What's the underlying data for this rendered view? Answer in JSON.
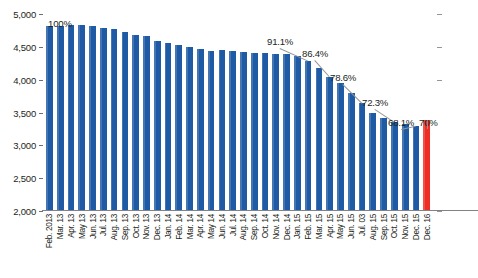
{
  "chart_data": {
    "type": "bar",
    "title": "",
    "subtitle": "",
    "xlabel": "",
    "ylabel": "",
    "ylim": [
      2000,
      5000
    ],
    "yticks": [
      "2,000",
      "2,500",
      "3,000",
      "3,500",
      "4,000",
      "4,500",
      "5,000"
    ],
    "ytick_values": [
      2000,
      2500,
      3000,
      3500,
      4000,
      4500,
      5000
    ],
    "grid": false,
    "legend": "none",
    "categories": [
      "Feb. 2013",
      "Mar. 13",
      "Apr. 13",
      "May 13",
      "Jun. 13",
      "Jul. 13",
      "Aug. 13",
      "Sep. 13",
      "Oct. 13",
      "Nov. 13",
      "Dec. 13",
      "Jan. 14",
      "Feb. 14",
      "Mar. 14",
      "Apr. 14",
      "May 14",
      "Jun. 14",
      "Jul. 14",
      "Aug. 14",
      "Sep. 14",
      "Oct. 14",
      "Nov. 14",
      "Dec. 14",
      "Jan. 15",
      "Feb. 15",
      "Mar. 15",
      "Apr. 15",
      "May 15",
      "Jun. 15",
      "Jul. 03",
      "Aug. 15",
      "Sep. 15",
      "Oct. 15",
      "Nov. 15",
      "Dec. 15",
      "Dec. 16"
    ],
    "values": [
      4800,
      4790,
      4810,
      4805,
      4800,
      4770,
      4750,
      4700,
      4660,
      4640,
      4570,
      4540,
      4500,
      4480,
      4440,
      4420,
      4425,
      4410,
      4400,
      4390,
      4380,
      4375,
      4370,
      4340,
      4260,
      4150,
      4020,
      3920,
      3780,
      3620,
      3470,
      3400,
      3330,
      3300,
      3270,
      3360
    ],
    "colors": [
      "#1f5ba4",
      "#1f5ba4",
      "#1f5ba4",
      "#1f5ba4",
      "#1f5ba4",
      "#1f5ba4",
      "#1f5ba4",
      "#1f5ba4",
      "#1f5ba4",
      "#1f5ba4",
      "#1f5ba4",
      "#1f5ba4",
      "#1f5ba4",
      "#1f5ba4",
      "#1f5ba4",
      "#1f5ba4",
      "#1f5ba4",
      "#1f5ba4",
      "#1f5ba4",
      "#1f5ba4",
      "#1f5ba4",
      "#1f5ba4",
      "#1f5ba4",
      "#1f5ba4",
      "#1f5ba4",
      "#1f5ba4",
      "#1f5ba4",
      "#1f5ba4",
      "#1f5ba4",
      "#1f5ba4",
      "#1f5ba4",
      "#1f5ba4",
      "#1f5ba4",
      "#1f5ba4",
      "#1f5ba4",
      "#ee2e24"
    ],
    "bar_color": "#1f5ba4",
    "highlight_color": "#ee2e24",
    "annotations": [
      {
        "label": "100%",
        "category": "Feb. 2013",
        "index": 0
      },
      {
        "label": "91.1%",
        "category": "Feb. 15",
        "index": 24
      },
      {
        "label": "86.4%",
        "category": "Apr. 15",
        "index": 26
      },
      {
        "label": "78.6%",
        "category": "Jul. 03",
        "index": 29
      },
      {
        "label": "72.3%",
        "category": "Oct. 15",
        "index": 32
      },
      {
        "label": "68.1%",
        "category": "Dec. 15",
        "index": 34
      },
      {
        "label": "70%",
        "category": "Dec. 16",
        "index": 35
      }
    ]
  }
}
